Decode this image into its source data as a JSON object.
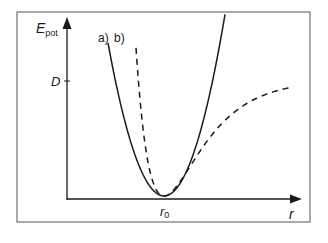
{
  "figure": {
    "type": "potential-energy-curve",
    "y_axis_label": "E",
    "y_axis_label_subscript": "pot",
    "x_axis_label": "r",
    "y_tick_label": "D",
    "x_tick_label": "r",
    "x_tick_label_subscript": "0",
    "curve_labels": {
      "a": "a)",
      "b": "b)"
    },
    "curves": [
      {
        "id": "a",
        "description": "harmonic potential (parabola)",
        "style": "solid"
      },
      {
        "id": "b",
        "description": "anharmonic (Morse-like) potential approaching dissociation energy D",
        "style": "dashed"
      }
    ],
    "colors": {
      "line": "#1a1a1a",
      "frame": "#555555",
      "background": "#ffffff"
    }
  }
}
